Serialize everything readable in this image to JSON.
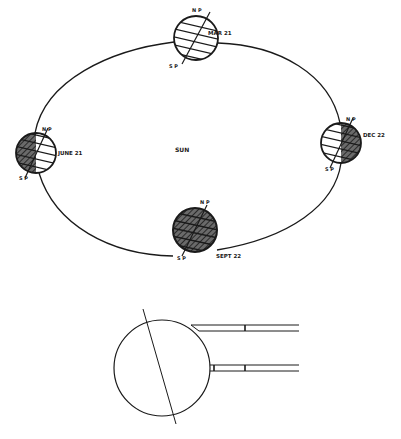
{
  "diagram": {
    "center_label": "SUN",
    "pole_labels": {
      "north": "N P",
      "south": "S P"
    },
    "positions": [
      {
        "id": "mar",
        "date": "MAR 21",
        "shading": "none"
      },
      {
        "id": "june",
        "date": "JUNE 21",
        "shading": "left-half"
      },
      {
        "id": "dec",
        "date": "DEC 22",
        "shading": "right-half"
      },
      {
        "id": "sept",
        "date": "SEPT 22",
        "shading": "full"
      }
    ],
    "inset": {
      "description": "Tilted globe with two parallel sun ray bands"
    }
  },
  "colors": {
    "line": "#1a1a1a",
    "shade": "#555555",
    "background": "#ffffff"
  }
}
